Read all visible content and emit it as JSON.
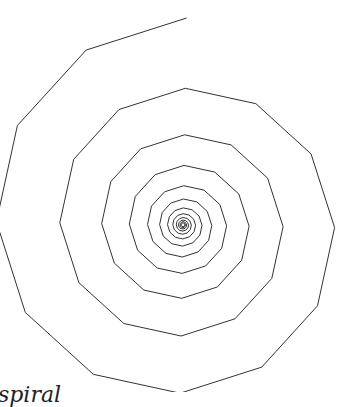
{
  "figure": {
    "type": "polygonal-spiral",
    "stroke_color": "#333333",
    "stroke_width": 1,
    "center": [
      183,
      225
    ],
    "start_radius": 207,
    "start_angle_deg": -89,
    "step_angle_deg": -30,
    "radius_ratio_per_step": 0.966,
    "min_radius": 1.5
  },
  "caption": {
    "text": "spiral"
  }
}
